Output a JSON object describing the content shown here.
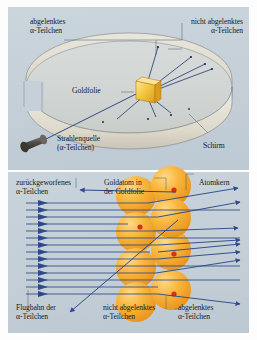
{
  "figure": {
    "language": "de"
  },
  "colors": {
    "panel_background": "#c6d0d9",
    "page_background": "#fdfdfd",
    "beam_blue": "#2d4a8a",
    "ray_blue": "#31497f",
    "gold_foil": "#f0c040",
    "gold_atom": "#f5a623",
    "gold_atom_light": "#fcd06a",
    "nucleus_red": "#d2331b",
    "screen_band": "#ddd9cc",
    "source_body": "#4a4641",
    "leader_line": "#5a646e",
    "text": "#14181d"
  },
  "top_panel": {
    "name": "rutherford-apparatus-view",
    "labels": {
      "deflected": {
        "line1": "abgelenktes",
        "line2": "α-Teilchen"
      },
      "undeflected": {
        "line1": "nicht abgelenktes",
        "line2": "α-Teilchen"
      },
      "gold_foil": "Goldfolie",
      "source": {
        "line1": "Strahlenquelle",
        "line2": "(α-Teilchen)"
      },
      "screen": "Schirm"
    },
    "elements": {
      "ring_name": "fluorescent-screen-ring",
      "foil_name": "gold-foil-target",
      "source_name": "alpha-radiation-source",
      "scintillation_count": 4
    }
  },
  "bottom_panel": {
    "name": "atomic-scattering-detail-view",
    "labels": {
      "backscattered": {
        "line1": "zurückgeworfenes",
        "line2": "α-Teilchen"
      },
      "gold_atom": {
        "line1": "Goldatom in",
        "line2": "der Goldfolie"
      },
      "nucleus": "Atomkern",
      "trajectory": {
        "line1": "Flugbahn der",
        "line2": "α-Teilchen"
      },
      "undeflected": {
        "line1": "nicht abgelenktes",
        "line2": "α-Teilchen"
      },
      "deflected": {
        "line1": "abgelenktes",
        "line2": "α-Teilchen"
      }
    },
    "elements": {
      "beam_line_count": 14,
      "atom_count": 7,
      "nucleus_count": 4
    }
  }
}
